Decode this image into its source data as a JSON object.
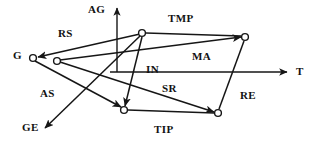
{
  "figure": {
    "background_color": "#ffffff",
    "ink_color": "#161616",
    "width": 320,
    "height": 144
  },
  "axes": [
    {
      "name": "vertical-axis",
      "label": "AG",
      "label_x": 88,
      "label_y": 4,
      "x1": 117,
      "y1": 72,
      "x2": 117,
      "y2": 8,
      "arrow": "up"
    },
    {
      "name": "horizontal-axis",
      "label": "T",
      "label_x": 296,
      "label_y": 66,
      "x1": 110,
      "y1": 72,
      "x2": 287,
      "y2": 72,
      "arrow": "right"
    }
  ],
  "nodes": [
    {
      "id": "n1",
      "name": "node-g-outer",
      "cx": 33,
      "cy": 58,
      "r": 3.4
    },
    {
      "id": "n2",
      "name": "node-g-inner",
      "cx": 57,
      "cy": 61,
      "r": 3.4
    },
    {
      "id": "n3",
      "name": "node-top-mid",
      "cx": 142,
      "cy": 33,
      "r": 3.4
    },
    {
      "id": "n4",
      "name": "node-top-right",
      "cx": 245,
      "cy": 37,
      "r": 3.4
    },
    {
      "id": "n5",
      "name": "node-bottom-mid",
      "cx": 124,
      "cy": 110,
      "r": 3.4
    },
    {
      "id": "n6",
      "name": "node-bottom-right",
      "cx": 218,
      "cy": 113,
      "r": 3.4
    }
  ],
  "edges": [
    {
      "name": "edge-rs",
      "label": "RS",
      "from": "n3",
      "to": "n1",
      "x1": 140,
      "y1": 34,
      "x2": 38,
      "y2": 57,
      "arrow": true
    },
    {
      "name": "edge-tmp",
      "label": "TMP",
      "from": "n3",
      "to": "n4",
      "x1": 146,
      "y1": 33,
      "x2": 241,
      "y2": 36,
      "arrow": false
    },
    {
      "name": "edge-ma",
      "label": "MA",
      "from": "n2",
      "to": "n4",
      "x1": 60,
      "y1": 60,
      "x2": 241,
      "y2": 37,
      "arrow": true
    },
    {
      "name": "edge-in",
      "label": "IN",
      "from": "n3",
      "to": "n5",
      "x1": 142,
      "y1": 37,
      "x2": 125,
      "y2": 106,
      "arrow": true
    },
    {
      "name": "edge-sr",
      "label": "SR",
      "from": "n2",
      "to": "n6",
      "x1": 60,
      "y1": 62,
      "x2": 214,
      "y2": 112,
      "arrow": true
    },
    {
      "name": "edge-tip",
      "label": "TIP",
      "from": "n5",
      "to": "n6",
      "x1": 128,
      "y1": 110,
      "x2": 214,
      "y2": 113,
      "arrow": false
    },
    {
      "name": "edge-re",
      "label": "RE",
      "from": "n6",
      "to": "n4",
      "x1": 219,
      "y1": 109,
      "x2": 244,
      "y2": 41,
      "arrow": false
    },
    {
      "name": "edge-as",
      "label": "AS",
      "from": "n1",
      "to": "n5",
      "x1": 35,
      "y1": 61,
      "x2": 121,
      "y2": 107,
      "arrow": true
    },
    {
      "name": "edge-ge",
      "label": "GE",
      "from": "n3",
      "to": "ge-tip",
      "x1": 140,
      "y1": 36,
      "x2": 45,
      "y2": 128,
      "arrow": true
    }
  ],
  "labels": [
    {
      "name": "label-ag",
      "text": "AG",
      "x": 88,
      "y": 4
    },
    {
      "name": "label-t",
      "text": "T",
      "x": 296,
      "y": 66
    },
    {
      "name": "label-g",
      "text": "G",
      "x": 13,
      "y": 50
    },
    {
      "name": "label-rs",
      "text": "RS",
      "x": 58,
      "y": 28
    },
    {
      "name": "label-tmp",
      "text": "TMP",
      "x": 168,
      "y": 13
    },
    {
      "name": "label-ma",
      "text": "MA",
      "x": 192,
      "y": 51
    },
    {
      "name": "label-in",
      "text": "IN",
      "x": 146,
      "y": 64
    },
    {
      "name": "label-sr",
      "text": "SR",
      "x": 162,
      "y": 83
    },
    {
      "name": "label-tip",
      "text": "TIP",
      "x": 154,
      "y": 124
    },
    {
      "name": "label-re",
      "text": "RE",
      "x": 240,
      "y": 90
    },
    {
      "name": "label-as",
      "text": "AS",
      "x": 40,
      "y": 88
    },
    {
      "name": "label-ge",
      "text": "GE",
      "x": 22,
      "y": 122
    }
  ]
}
